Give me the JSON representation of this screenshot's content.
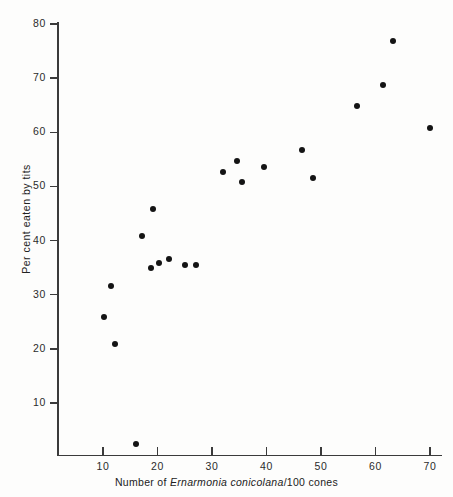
{
  "figure": {
    "background_color": "#fdfdfc",
    "axis_color": "#3b3b3b",
    "marker_color": "#141414"
  },
  "axes": {
    "x_title_prefix": "Number of ",
    "x_title_species": "Ernarmonia conicolana",
    "x_title_suffix": "/100 cones",
    "x_title_full": "Number of Ernarmonia conicolana/100 cones",
    "y_title": "Per cent eaten by tits",
    "x_ticks": [
      10,
      20,
      30,
      40,
      50,
      60,
      70
    ],
    "y_ticks": [
      10,
      20,
      30,
      40,
      50,
      60,
      70,
      80
    ]
  },
  "chart_data": {
    "type": "scatter",
    "title": "",
    "xlabel": "Number of Ernarmonia conicolana/100 cones",
    "ylabel": "Per cent eaten by tits",
    "xlim": [
      3,
      73
    ],
    "ylim": [
      0,
      80
    ],
    "xticks": [
      10,
      20,
      30,
      40,
      50,
      60,
      70
    ],
    "yticks": [
      10,
      20,
      30,
      40,
      50,
      60,
      70,
      80
    ],
    "grid": false,
    "legend": null,
    "series": [
      {
        "name": "cones eaten by tits",
        "marker": "filled-circle",
        "color": "#141414",
        "points": [
          {
            "x": 16.1,
            "y": 2.5
          },
          {
            "x": 10.2,
            "y": 25.9
          },
          {
            "x": 11.5,
            "y": 31.6
          },
          {
            "x": 12.2,
            "y": 20.9
          },
          {
            "x": 17.2,
            "y": 40.8
          },
          {
            "x": 18.8,
            "y": 34.9
          },
          {
            "x": 19.2,
            "y": 45.8
          },
          {
            "x": 20.3,
            "y": 35.9
          },
          {
            "x": 22.1,
            "y": 36.6
          },
          {
            "x": 25.0,
            "y": 35.5
          },
          {
            "x": 27.1,
            "y": 35.5
          },
          {
            "x": 32.0,
            "y": 52.7
          },
          {
            "x": 34.6,
            "y": 54.7
          },
          {
            "x": 35.5,
            "y": 50.8
          },
          {
            "x": 39.5,
            "y": 53.6
          },
          {
            "x": 46.5,
            "y": 56.7
          },
          {
            "x": 48.5,
            "y": 51.6
          },
          {
            "x": 56.6,
            "y": 64.9
          },
          {
            "x": 61.4,
            "y": 68.7
          },
          {
            "x": 63.2,
            "y": 76.9
          },
          {
            "x": 70.0,
            "y": 60.8
          }
        ]
      }
    ]
  }
}
